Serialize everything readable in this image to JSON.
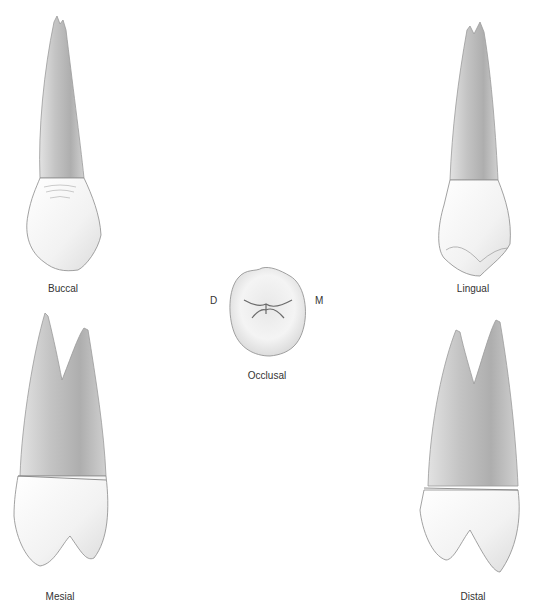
{
  "figure": {
    "views": [
      {
        "id": "buccal",
        "label": "Buccal"
      },
      {
        "id": "lingual",
        "label": "Lingual"
      },
      {
        "id": "occlusal",
        "label": "Occlusal"
      },
      {
        "id": "mesial",
        "label": "Mesial"
      },
      {
        "id": "distal",
        "label": "Distal"
      }
    ],
    "orientation": {
      "distal_marker": "D",
      "mesial_marker": "M"
    }
  },
  "colors": {
    "root_shade": "#b8b8b8",
    "crown_fill": "#f6f6f6",
    "outline": "#7a7a7a",
    "text": "#333333"
  }
}
